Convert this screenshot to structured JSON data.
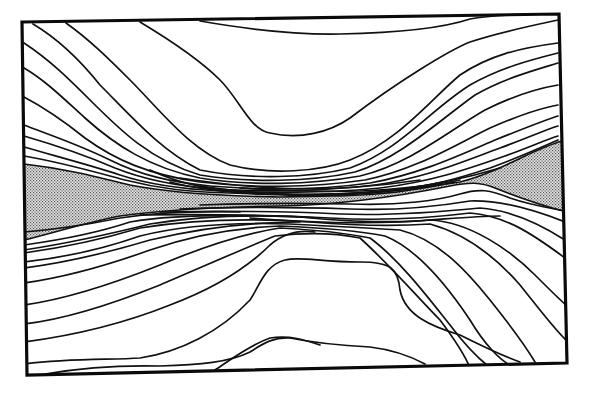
{
  "figure": {
    "colors": {
      "line": "#111111",
      "background": "#ffffff",
      "stipple_dark": "#555555",
      "stipple_light": "#e8e8e8"
    },
    "labels": [],
    "upper_line_count": 17,
    "lower_line_count": 18,
    "shaded_band": {
      "pattern": "stipple",
      "shape": "pinched at center, widest at left and right edges"
    }
  }
}
